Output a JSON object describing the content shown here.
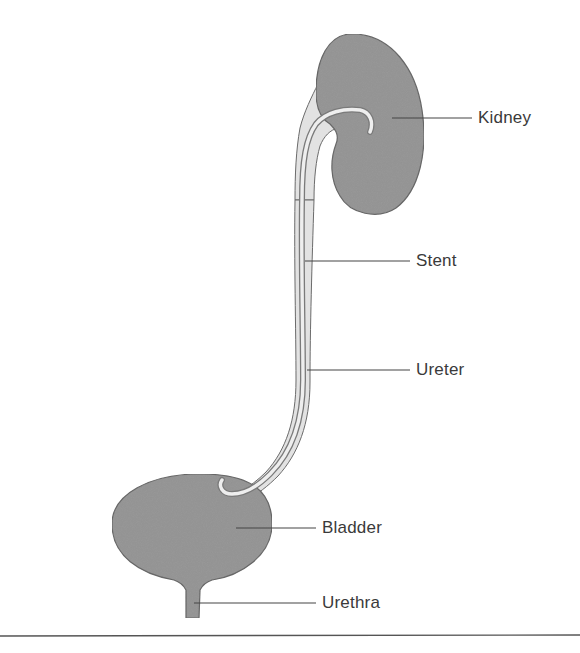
{
  "diagram": {
    "colors": {
      "organ_fill": "#9a9a9a",
      "organ_stroke": "#6b6b6b",
      "ureter_fill": "#e2e2e2",
      "stent_stroke": "#7a7a7a",
      "leader_line": "#444444",
      "label_text": "#3a3a3a",
      "rule": "#555555",
      "background": "#ffffff"
    },
    "labels": [
      {
        "id": "kidney",
        "text": "Kidney"
      },
      {
        "id": "stent",
        "text": "Stent"
      },
      {
        "id": "ureter",
        "text": "Ureter"
      },
      {
        "id": "bladder",
        "text": "Bladder"
      },
      {
        "id": "urethra",
        "text": "Urethra"
      }
    ],
    "structures": [
      "kidney",
      "ureter",
      "stent",
      "bladder",
      "urethra"
    ]
  }
}
